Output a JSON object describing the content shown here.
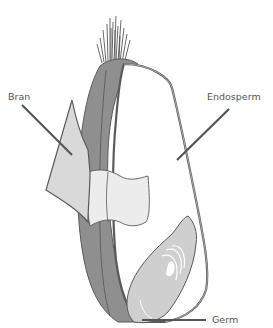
{
  "labels": {
    "bran": "Bran",
    "endosperm": "Endosperm",
    "germ": "Germ"
  },
  "colors": {
    "bran_dark": "#8f8f8f",
    "bran_light": "#d9d9d9",
    "bran_mid": "#ececec",
    "endosperm": "#ffffff",
    "germ": "#cfcfcf",
    "outline": "#5a5a5a",
    "leader": "#555555",
    "text": "#555555"
  }
}
